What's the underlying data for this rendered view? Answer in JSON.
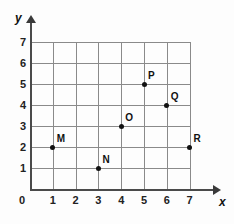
{
  "chart_data": {
    "type": "scatter",
    "title": "",
    "xlabel": "x",
    "ylabel": "y",
    "xlim": [
      0,
      7
    ],
    "ylim": [
      0,
      7
    ],
    "grid": true,
    "legend": "none",
    "x_ticks": [
      "0",
      "1",
      "2",
      "3",
      "4",
      "5",
      "6",
      "7"
    ],
    "y_ticks": [
      "0",
      "1",
      "2",
      "3",
      "4",
      "5",
      "6",
      "7"
    ],
    "origin_label": "0",
    "points": [
      {
        "label": "M",
        "x": 1,
        "y": 2
      },
      {
        "label": "N",
        "x": 3,
        "y": 1
      },
      {
        "label": "O",
        "x": 4,
        "y": 3
      },
      {
        "label": "P",
        "x": 5,
        "y": 5
      },
      {
        "label": "Q",
        "x": 6,
        "y": 4
      },
      {
        "label": "R",
        "x": 7,
        "y": 2
      }
    ]
  },
  "colors": {
    "grid": "#8a8a8a",
    "axis": "#4a4a4a",
    "point": "#111111",
    "background": "#fdfdfd"
  }
}
